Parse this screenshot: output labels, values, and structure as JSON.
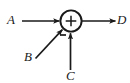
{
  "figure": {
    "kind": "block-diagram",
    "width": 130,
    "height": 83,
    "background_color": "#ffffff",
    "stroke_color": "#1a1a1a"
  },
  "junction": {
    "name": "summing-junction",
    "shape": "circle",
    "center_x": 71,
    "center_y": 21,
    "radius": 11,
    "operator_symbol": "+"
  },
  "signals": {
    "input_a": {
      "label": "A",
      "direction": "left-to-right",
      "sign": "+"
    },
    "input_b": {
      "label": "B",
      "direction": "diagonal-up-right",
      "sign": "+"
    },
    "input_c": {
      "label": "C",
      "direction": "bottom-to-top",
      "sign": "-",
      "sign_symbol": "−"
    },
    "output_d": {
      "label": "D",
      "direction": "left-to-right"
    }
  }
}
